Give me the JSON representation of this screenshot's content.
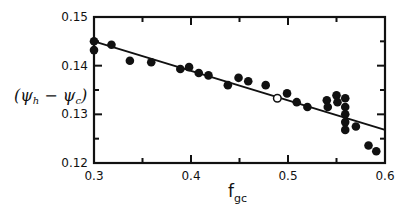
{
  "chart_data": {
    "type": "scatter",
    "title": "",
    "xlabel": "f_gc",
    "xlabel_main": "f",
    "xlabel_sub": "gc",
    "ylabel": "(ψh − ψc)",
    "ylabel_parts": {
      "open": "(ψ",
      "sub1": "h",
      "mid": " − ψ",
      "sub2": "c",
      "close": ")"
    },
    "xlim": [
      0.3,
      0.6
    ],
    "ylim": [
      0.12,
      0.15
    ],
    "x_ticks": [
      0.3,
      0.4,
      0.5,
      0.6
    ],
    "x_tick_labels": [
      "0.3",
      "0.4",
      "0.5",
      "0.6"
    ],
    "x_minor_ticks": [
      0.35,
      0.45,
      0.55
    ],
    "y_ticks": [
      0.12,
      0.13,
      0.14,
      0.15
    ],
    "y_tick_labels": [
      "0.12",
      "0.13",
      "0.14",
      "0.15"
    ],
    "y_minor_ticks": [
      0.125,
      0.135,
      0.145
    ],
    "grid": false,
    "legend": null,
    "series": [
      {
        "name": "filled points",
        "marker": "filled-circle",
        "points": [
          [
            0.3,
            0.145
          ],
          [
            0.3,
            0.1432
          ],
          [
            0.318,
            0.1443
          ],
          [
            0.337,
            0.141
          ],
          [
            0.359,
            0.1407
          ],
          [
            0.389,
            0.1393
          ],
          [
            0.398,
            0.1397
          ],
          [
            0.408,
            0.1385
          ],
          [
            0.418,
            0.138
          ],
          [
            0.438,
            0.136
          ],
          [
            0.449,
            0.1375
          ],
          [
            0.459,
            0.1368
          ],
          [
            0.477,
            0.136
          ],
          [
            0.499,
            0.1343
          ],
          [
            0.509,
            0.1325
          ],
          [
            0.52,
            0.1315
          ],
          [
            0.54,
            0.1329
          ],
          [
            0.541,
            0.1315
          ],
          [
            0.55,
            0.1339
          ],
          [
            0.551,
            0.1325
          ],
          [
            0.559,
            0.1333
          ],
          [
            0.559,
            0.1315
          ],
          [
            0.559,
            0.13
          ],
          [
            0.559,
            0.1284
          ],
          [
            0.559,
            0.1268
          ],
          [
            0.57,
            0.1275
          ],
          [
            0.583,
            0.1236
          ],
          [
            0.591,
            0.1224
          ]
        ]
      },
      {
        "name": "open point",
        "marker": "open-circle",
        "points": [
          [
            0.489,
            0.1333
          ]
        ]
      },
      {
        "name": "fit line",
        "type": "line",
        "points": [
          [
            0.3,
            0.145
          ],
          [
            0.6,
            0.1268
          ]
        ]
      }
    ]
  },
  "colors": {
    "ink": "#111111",
    "background": "#ffffff"
  }
}
